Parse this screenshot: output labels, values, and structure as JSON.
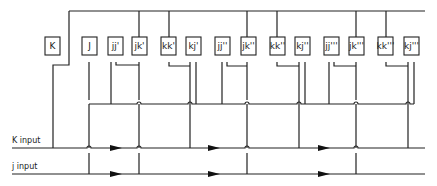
{
  "diagram": {
    "boxes": [
      {
        "label": "K",
        "x": 45
      },
      {
        "label": "J",
        "x": 82
      },
      {
        "label": "jj'",
        "x": 108
      },
      {
        "label": "jk'",
        "x": 132
      },
      {
        "label": "kk'",
        "x": 161
      },
      {
        "label": "kj'",
        "x": 186
      },
      {
        "label": "jj''",
        "x": 215
      },
      {
        "label": "jk''",
        "x": 241
      },
      {
        "label": "kk''",
        "x": 270
      },
      {
        "label": "kj''",
        "x": 295
      },
      {
        "label": "jj'''",
        "x": 324
      },
      {
        "label": "jk'''",
        "x": 349
      },
      {
        "label": "kk'''",
        "x": 378
      },
      {
        "label": "kj'''",
        "x": 404
      }
    ],
    "inputs": {
      "k_label": "K input",
      "j_label": "j input"
    },
    "colors": {
      "line": "#222222",
      "background": "#ffffff"
    }
  }
}
